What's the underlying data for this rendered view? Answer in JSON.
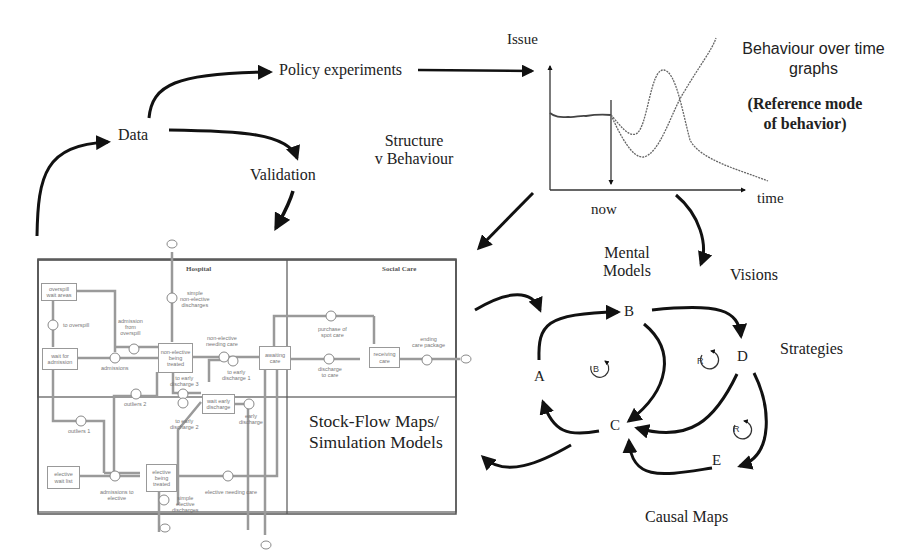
{
  "flow_labels": {
    "data": "Data",
    "policy_experiments": "Policy experiments",
    "validation": "Validation",
    "structure_v_behaviour": [
      "Structure",
      "v Behaviour"
    ],
    "mental_models": [
      "Mental",
      "Models"
    ],
    "visions": "Visions",
    "strategies": "Strategies",
    "causal_maps": "Causal Maps"
  },
  "behaviour_graph": {
    "y_axis_label": "Issue",
    "x_axis_label": "time",
    "marker_label": "now",
    "title": [
      "Behaviour over time",
      "graphs"
    ],
    "subtitle": [
      "(Reference mode",
      "of behavior)"
    ]
  },
  "stock_flow_map": {
    "caption": [
      "Stock-Flow Maps/",
      "Simulation Models"
    ],
    "sections": {
      "hospital": "Hospital",
      "social_care": "Social Care"
    },
    "stocks": {
      "overspill_wait_areas": [
        "overspill",
        "wait areas"
      ],
      "wait_for_admission": [
        "wait for",
        "admission"
      ],
      "non_elective_being_treated": [
        "non-elective",
        "being",
        "treated"
      ],
      "awaiting_care": [
        "awaiting",
        "care"
      ],
      "wait_early_discharge": [
        "wait early",
        "discharge"
      ],
      "elective_wait_list": [
        "elective",
        "wait list"
      ],
      "elective_being_treated": [
        "elective",
        "being",
        "treated"
      ],
      "receiving_care": [
        "receiving",
        "care"
      ]
    },
    "flows": {
      "to_overspill": "to overspill",
      "admission_from_overspill": [
        "admission",
        "from",
        "overspill"
      ],
      "admissions": "admissions",
      "simple_non_elective_discharges": [
        "simple",
        "non-elective",
        "discharges"
      ],
      "non_elective_needing_care": [
        "non-elective",
        "needing care"
      ],
      "to_early_discharge_1": [
        "to early",
        "discharge 1"
      ],
      "to_early_discharge_3": [
        "to early",
        "discharge 3"
      ],
      "to_early_discharge_2": [
        "to early",
        "discharge 2"
      ],
      "outliers_2": "outliers 2",
      "outliers_1": "outliers 1",
      "early_discharge": [
        "early",
        "discharge"
      ],
      "admissions_to_elective": [
        "admissions to",
        "elective"
      ],
      "simple_elective_discharges": [
        "simple",
        "elective",
        "discharges"
      ],
      "elective_needing_care": "elective needing care",
      "purchase_of_spot_care": [
        "purchase of",
        "spot care"
      ],
      "discharge_to_care": [
        "discharge",
        "to care"
      ],
      "ending_care_package": [
        "ending",
        "care package"
      ]
    }
  },
  "causal_map": {
    "nodes": [
      "A",
      "B",
      "C",
      "D",
      "E"
    ],
    "loops": [
      {
        "type": "B",
        "meaning": "balancing"
      },
      {
        "type": "R",
        "meaning": "reinforcing"
      },
      {
        "type": "R",
        "meaning": "reinforcing"
      }
    ]
  }
}
